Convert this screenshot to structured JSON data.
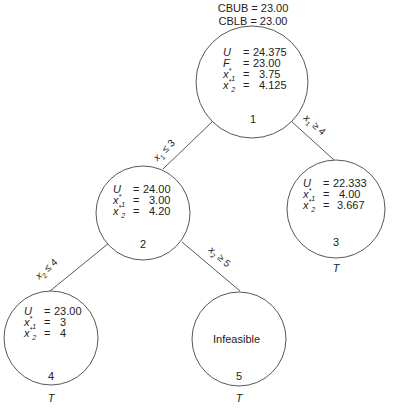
{
  "header": {
    "cbub": "CBUB = 23.00",
    "cblb": "CBLB = 23.00"
  },
  "nodes": [
    {
      "id": "1",
      "rows": [
        {
          "var": "U",
          "sub": "",
          "eq": "=",
          "val": "24.375"
        },
        {
          "var": "F",
          "sub": "",
          "eq": "=",
          "val": "23.00"
        },
        {
          "var": "x",
          "sub": "1",
          "eq": "=",
          "val": "3.75"
        },
        {
          "var": "x",
          "sub": "2",
          "eq": "=",
          "val": "4.125"
        }
      ],
      "terminal": ""
    },
    {
      "id": "2",
      "rows": [
        {
          "var": "U",
          "sub": "",
          "eq": "=",
          "val": "24.00"
        },
        {
          "var": "x",
          "sub": "1",
          "eq": "=",
          "val": "3.00"
        },
        {
          "var": "x",
          "sub": "2",
          "eq": "=",
          "val": "4.20"
        }
      ],
      "terminal": ""
    },
    {
      "id": "3",
      "rows": [
        {
          "var": "U",
          "sub": "",
          "eq": "=",
          "val": "22.333"
        },
        {
          "var": "x",
          "sub": "1",
          "eq": "=",
          "val": "4.00"
        },
        {
          "var": "x",
          "sub": "2",
          "eq": "=",
          "val": "3.667"
        }
      ],
      "terminal": "T"
    },
    {
      "id": "4",
      "rows": [
        {
          "var": "U",
          "sub": "",
          "eq": "=",
          "val": "23.00"
        },
        {
          "var": "x",
          "sub": "1",
          "eq": "=",
          "val": "3"
        },
        {
          "var": "x",
          "sub": "2",
          "eq": "=",
          "val": "4"
        }
      ],
      "terminal": "T"
    },
    {
      "id": "5",
      "text": "Infeasible",
      "terminal": "T"
    }
  ],
  "edges": [
    {
      "from": "1",
      "to": "2",
      "label": "x1 ≤ 3"
    },
    {
      "from": "1",
      "to": "3",
      "label": "x1 ≥ 4"
    },
    {
      "from": "2",
      "to": "4",
      "label": "x2 ≤ 4"
    },
    {
      "from": "2",
      "to": "5",
      "label": "x2 ≥ 5"
    }
  ],
  "star": "*"
}
